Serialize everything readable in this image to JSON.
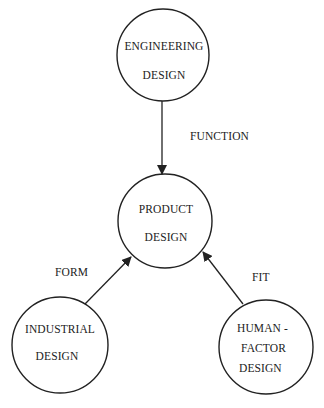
{
  "diagram": {
    "type": "concept-diagram",
    "nodes": [
      {
        "id": "engineering",
        "line1": "ENGINEERING",
        "line2": "DESIGN",
        "cx": 163,
        "cy": 55,
        "r": 46
      },
      {
        "id": "product",
        "line1": "PRODUCT",
        "line2": "DESIGN",
        "cx": 165,
        "cy": 221,
        "r": 47
      },
      {
        "id": "industrial",
        "line1": "INDUSTRIAL",
        "line2": "DESIGN",
        "cx": 60,
        "cy": 345,
        "r": 48
      },
      {
        "id": "human-factor",
        "line1": "HUMAN -",
        "line2": "FACTOR",
        "line3": "DESIGN",
        "cx": 266,
        "cy": 347,
        "r": 47
      }
    ],
    "edges": [
      {
        "from": "engineering",
        "to": "product",
        "label": "FUNCTION"
      },
      {
        "from": "industrial",
        "to": "product",
        "label": "FORM"
      },
      {
        "from": "human-factor",
        "to": "product",
        "label": "FIT"
      }
    ],
    "colors": {
      "stroke": "#222222",
      "background": "#ffffff"
    }
  }
}
